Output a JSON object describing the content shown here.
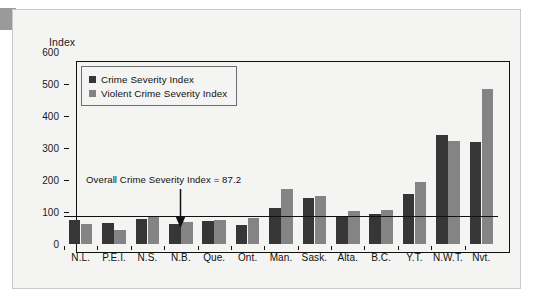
{
  "figure": {
    "axis_title": "Index",
    "panel_background": "#f4f4f2",
    "corner_accent_color": "#9a9a9a"
  },
  "chart_data": {
    "type": "bar",
    "title": "",
    "xlabel": "",
    "ylabel": "Index",
    "ylim": [
      0,
      600
    ],
    "yticks": [
      0,
      100,
      200,
      300,
      400,
      500,
      600
    ],
    "grid": false,
    "legend_position": "top-left",
    "categories": [
      "N.L.",
      "P.E.I.",
      "N.S.",
      "N.B.",
      "Que.",
      "Ont.",
      "Man.",
      "Sask.",
      "Alta.",
      "B.C.",
      "Y.T.",
      "N.W.T.",
      "Nvt."
    ],
    "series": [
      {
        "name": "Crime Severity Index",
        "color": "#363636",
        "values": [
          74,
          66,
          79,
          64,
          71,
          60,
          114,
          143,
          83,
          93,
          156,
          340,
          320
        ]
      },
      {
        "name": "Violent Crime Severity Index",
        "color": "#848484",
        "values": [
          62,
          43,
          89,
          70,
          76,
          80,
          173,
          151,
          102,
          107,
          193,
          323,
          484
        ]
      }
    ],
    "annotations": [
      {
        "text": "Overall Crime Severity Index = 87.2",
        "value": 87.2,
        "points_to_category": "N.B.",
        "arrow": "down-arrow"
      }
    ],
    "reference_line": {
      "value": 87.2,
      "color": "#111111"
    }
  }
}
